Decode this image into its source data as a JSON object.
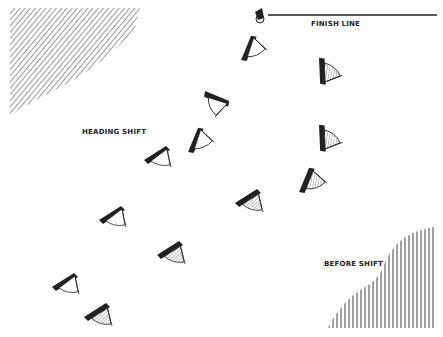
{
  "labels": {
    "finish_line": "FINISH LINE",
    "heading_shift": "HEADING SHIFT",
    "before_shift": "BEFORE SHIFT"
  },
  "colors": {
    "ink": "#222222",
    "hatch": "#555555",
    "background": "#ffffff"
  },
  "regions": {
    "top_left_hatched_area": "diagonal hatching",
    "bottom_right_hatched_area": "vertical hatching"
  },
  "boats": {
    "white_sails_fleet": [
      {
        "x": 250,
        "y": 50,
        "heading": "horizontal"
      },
      {
        "x": 215,
        "y": 100,
        "heading": "up"
      },
      {
        "x": 195,
        "y": 143,
        "heading": "horizontal"
      },
      {
        "x": 157,
        "y": 158,
        "heading": "diagonal"
      },
      {
        "x": 111,
        "y": 218,
        "heading": "diagonal"
      },
      {
        "x": 65,
        "y": 285,
        "heading": "diagonal"
      }
    ],
    "hatched_sails_fleet": [
      {
        "x": 324,
        "y": 70,
        "heading": "up"
      },
      {
        "x": 324,
        "y": 138,
        "heading": "up"
      },
      {
        "x": 307,
        "y": 182,
        "heading": "horizontal"
      },
      {
        "x": 248,
        "y": 202,
        "heading": "diagonal"
      },
      {
        "x": 170,
        "y": 253,
        "heading": "diagonal"
      },
      {
        "x": 97,
        "y": 315,
        "heading": "diagonal"
      }
    ]
  }
}
